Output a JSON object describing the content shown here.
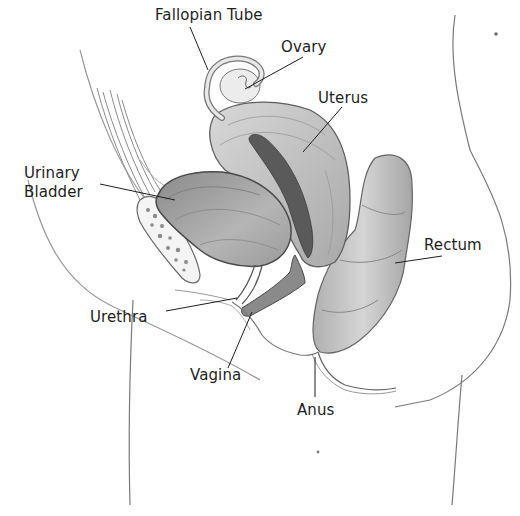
{
  "diagram": {
    "type": "anatomical-illustration",
    "colors": {
      "background": "#ffffff",
      "ink": "#1e1e1e",
      "organ_shade": "#b8b8b8",
      "organ_dark": "#6a6a6a"
    },
    "labels": [
      {
        "id": "fallopian-tube",
        "text": "Fallopian Tube",
        "x": 155,
        "y": 6
      },
      {
        "id": "ovary",
        "text": "Ovary",
        "x": 281,
        "y": 38
      },
      {
        "id": "uterus",
        "text": "Uterus",
        "x": 318,
        "y": 89
      },
      {
        "id": "urinary-bladder-line1",
        "text": "Urinary",
        "x": 24,
        "y": 164
      },
      {
        "id": "urinary-bladder-line2",
        "text": "Bladder",
        "x": 24,
        "y": 183
      },
      {
        "id": "rectum",
        "text": "Rectum",
        "x": 424,
        "y": 236
      },
      {
        "id": "urethra",
        "text": "Urethra",
        "x": 90,
        "y": 308
      },
      {
        "id": "vagina",
        "text": "Vagina",
        "x": 190,
        "y": 366
      },
      {
        "id": "anus",
        "text": "Anus",
        "x": 297,
        "y": 401
      }
    ]
  }
}
